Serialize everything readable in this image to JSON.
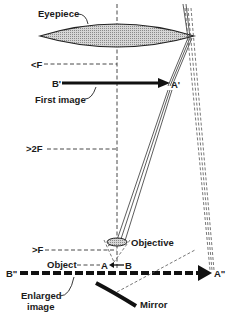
{
  "diagram": {
    "labels": {
      "eyepiece": "Eyepiece",
      "less_than_f": "<F",
      "first_image_b": "B'",
      "first_image_a": "A'",
      "first_image": "First image",
      "greater_2f": ">2F",
      "greater_f": ">F",
      "objective": "Objective",
      "object": "Object",
      "object_a": "A",
      "object_b": "B",
      "enlarged_b": "B\"",
      "enlarged_a": "A\"",
      "enlarged_image_line1": "Enlarged",
      "enlarged_image_line2": "image",
      "mirror": "Mirror"
    },
    "colors": {
      "ink": "#1a1a1a",
      "lens_fill": "#c8c8c8",
      "background": "#ffffff"
    }
  }
}
